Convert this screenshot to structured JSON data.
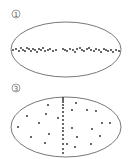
{
  "panels": [
    {
      "label": "1",
      "description": "Points concentrated along horizontal axis of ellipse",
      "ellipse": {
        "cx": 66,
        "cy": 49.5,
        "rx": 55,
        "ry": 27.5
      },
      "label_pos": {
        "x": 16,
        "y": 14
      },
      "points": [
        [
          13,
          50
        ],
        [
          16,
          49
        ],
        [
          19,
          51
        ],
        [
          21,
          48
        ],
        [
          23,
          50
        ],
        [
          25,
          51
        ],
        [
          27,
          48
        ],
        [
          29,
          49
        ],
        [
          31,
          51
        ],
        [
          33,
          49
        ],
        [
          35,
          50
        ],
        [
          37,
          52
        ],
        [
          39,
          49
        ],
        [
          41,
          50
        ],
        [
          43,
          48
        ],
        [
          45,
          51
        ],
        [
          48,
          50
        ],
        [
          50,
          49
        ],
        [
          53,
          51
        ],
        [
          56,
          50
        ],
        [
          63,
          49
        ],
        [
          65,
          50
        ],
        [
          67,
          51
        ],
        [
          70,
          49
        ],
        [
          73,
          50
        ],
        [
          75,
          52
        ],
        [
          77,
          49
        ],
        [
          80,
          48
        ],
        [
          82,
          50
        ],
        [
          84,
          51
        ],
        [
          87,
          49
        ],
        [
          89,
          48
        ],
        [
          91,
          50
        ],
        [
          94,
          51
        ],
        [
          96,
          49
        ],
        [
          99,
          50
        ],
        [
          101,
          52
        ],
        [
          104,
          49
        ],
        [
          106,
          50
        ],
        [
          108,
          51
        ],
        [
          111,
          50
        ],
        [
          113,
          52
        ],
        [
          116,
          50
        ],
        [
          119,
          51
        ]
      ]
    },
    {
      "label": "3",
      "description": "Points scattered with vertical column at center",
      "ellipse": {
        "cx": 66,
        "cy": 127,
        "rx": 55,
        "ry": 30
      },
      "label_pos": {
        "x": 16,
        "y": 88
      },
      "points": [
        [
          48,
          105
        ],
        [
          27,
          116
        ],
        [
          46,
          114
        ],
        [
          58,
          118
        ],
        [
          18,
          127
        ],
        [
          39,
          123
        ],
        [
          49,
          134
        ],
        [
          31,
          137
        ],
        [
          45,
          143
        ],
        [
          76,
          103
        ],
        [
          72,
          110
        ],
        [
          87,
          110
        ],
        [
          96,
          111
        ],
        [
          102,
          123
        ],
        [
          110,
          123
        ],
        [
          72,
          128
        ],
        [
          92,
          129
        ],
        [
          77,
          137
        ],
        [
          100,
          136
        ],
        [
          67,
          144
        ],
        [
          75,
          147
        ],
        [
          91,
          144
        ],
        [
          63,
          98
        ],
        [
          63,
          100
        ],
        [
          63,
          102
        ],
        [
          63,
          105
        ],
        [
          63,
          108
        ],
        [
          63,
          112
        ],
        [
          63,
          116
        ],
        [
          63,
          120
        ],
        [
          63,
          124
        ],
        [
          63,
          128
        ],
        [
          63,
          131
        ],
        [
          63,
          135
        ],
        [
          63,
          139
        ],
        [
          63,
          144
        ],
        [
          63,
          149
        ],
        [
          63,
          153
        ]
      ]
    }
  ],
  "style": {
    "stroke": "#555555",
    "point": "#222222"
  }
}
